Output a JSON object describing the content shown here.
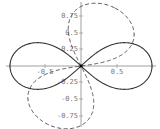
{
  "chart_data": {
    "type": "line",
    "title": "",
    "xlabel": "",
    "ylabel": "",
    "xlim": [
      -1,
      1
    ],
    "ylim": [
      -0.85,
      0.85
    ],
    "grid": false,
    "legend": null,
    "x_ticks": [
      "-0.5",
      "0.5"
    ],
    "y_ticks": [
      "0.75",
      "0.5",
      "0.25",
      "-0.25",
      "-0.5",
      "-0.75"
    ],
    "series": [
      {
        "name": "lemniscate (solid)",
        "style": "solid",
        "description": "Figure-eight lemniscate r^2 = cos(2θ), extends x from -1 to 1, max |y| ≈ 0.35",
        "x": [
          1.0,
          0.9,
          0.7,
          0.5,
          0.3,
          0.1,
          0.0,
          -0.1,
          -0.3,
          -0.5,
          -0.7,
          -0.9,
          -1.0
        ],
        "y_upper": [
          0.0,
          0.25,
          0.34,
          0.34,
          0.26,
          0.1,
          0.0,
          0.1,
          0.26,
          0.34,
          0.34,
          0.25,
          0.0
        ]
      },
      {
        "name": "rotated lemniscate (dashed)",
        "style": "dashed",
        "description": "Same lemniscate rotated ~60°, lobes in upper-right and lower-left quadrants, reaching y ≈ ±0.8",
        "lobe_extent": {
          "x": [
            -0.6,
            0.6
          ],
          "y": [
            -0.8,
            0.8
          ]
        }
      }
    ]
  },
  "axes": {
    "y_tick_labels": [
      "0.75",
      "0.5",
      "0.25",
      "-0.25",
      "-0.5",
      "-0.75"
    ],
    "x_tick_labels": [
      "-0.5",
      "0.5"
    ]
  }
}
